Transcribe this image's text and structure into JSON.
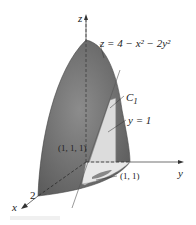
{
  "diagram": {
    "type": "3d-surface-plot",
    "surface": {
      "equation": "z = 4 − x² − 2y²",
      "equation_parts": {
        "lhs": "z",
        "eq": "=",
        "rhs": "4 − x² − 2y²"
      },
      "color": "#6e6e6e",
      "highlight_color": "#8a8a8a"
    },
    "plane": {
      "label": "y = 1",
      "color": "#dcdcdc"
    },
    "curve": {
      "label": "C",
      "subscript": "1"
    },
    "points": [
      {
        "label": "(1, 1, 1)"
      },
      {
        "label": "(1, 1)"
      }
    ],
    "axes": {
      "x": {
        "label": "x",
        "tick": "2"
      },
      "y": {
        "label": "y"
      },
      "z": {
        "label": "z"
      }
    },
    "colors": {
      "axis": "#333333",
      "dashed": "#222222",
      "background": "#ffffff"
    }
  }
}
